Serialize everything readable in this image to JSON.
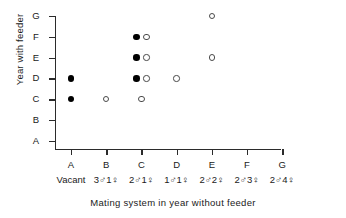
{
  "chart_data": {
    "type": "scatter",
    "title": "",
    "xlabel": "Mating system in year without feeder",
    "ylabel": "Year with feeder",
    "grid": false,
    "legend": null,
    "x_categories": [
      "A",
      "B",
      "C",
      "D",
      "E",
      "F",
      "G"
    ],
    "x_category_sublabels": [
      "Vacant",
      "3♂3 1♀",
      "2♂ 1♀",
      "1♂ 1♀",
      "2♂ 2♀",
      "2♂ 3♀",
      "2♂ 4♀"
    ],
    "x_sublabels": [
      "Vacant",
      "3♂1♀",
      "2♂1♀",
      "1♂1♀",
      "2♂2♀",
      "2♂3♀",
      "2♂4♀"
    ],
    "y_categories": [
      "A",
      "B",
      "C",
      "D",
      "E",
      "F",
      "G"
    ],
    "marker_styles": {
      "filled": "filled black circle",
      "open": "open white circle with dark outline"
    },
    "points": [
      {
        "x": "A",
        "y": "D",
        "marker": "filled",
        "offset": 0
      },
      {
        "x": "A",
        "y": "C",
        "marker": "filled",
        "offset": 0
      },
      {
        "x": "B",
        "y": "C",
        "marker": "open",
        "offset": 0
      },
      {
        "x": "C",
        "y": "F",
        "marker": "filled",
        "offset": -5
      },
      {
        "x": "C",
        "y": "F",
        "marker": "open",
        "offset": 5
      },
      {
        "x": "C",
        "y": "E",
        "marker": "filled",
        "offset": -5
      },
      {
        "x": "C",
        "y": "E",
        "marker": "open",
        "offset": 5
      },
      {
        "x": "C",
        "y": "D",
        "marker": "filled",
        "offset": -5
      },
      {
        "x": "C",
        "y": "D",
        "marker": "open",
        "offset": 5
      },
      {
        "x": "C",
        "y": "C",
        "marker": "open",
        "offset": 0
      },
      {
        "x": "D",
        "y": "D",
        "marker": "open",
        "offset": 0
      },
      {
        "x": "E",
        "y": "G",
        "marker": "open",
        "offset": 0
      },
      {
        "x": "E",
        "y": "E",
        "marker": "open",
        "offset": 0
      }
    ],
    "counts": {
      "filled": 5,
      "open": 8,
      "total": 13
    }
  },
  "colors": {
    "axis": "#2b2b2b",
    "filled_marker": "#000000",
    "open_marker_edge": "#4a4a4a",
    "background": "#ffffff",
    "text": "#1a1a1a"
  }
}
